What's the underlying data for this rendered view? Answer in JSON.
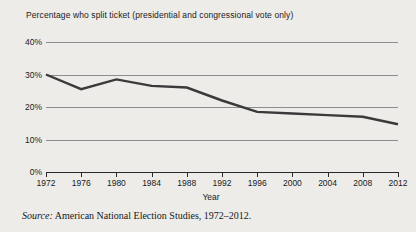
{
  "figure": {
    "title": "Percentage who split ticket (presidential and congressional vote only)",
    "source_prefix": "Source:",
    "source_text": "American National Election Studies, 1972–2012.",
    "xlabel": "Year",
    "line_color": "#3a3a3a",
    "grid_color": "#8d8d8d",
    "background": "#edece9"
  },
  "chart_data": {
    "type": "line",
    "title": "Percentage who split ticket (presidential and congressional vote only)",
    "xlabel": "Year",
    "ylabel": "",
    "x": [
      1972,
      1976,
      1980,
      1984,
      1988,
      1992,
      1996,
      2000,
      2004,
      2008,
      2012
    ],
    "categories": [
      "1972",
      "1976",
      "1980",
      "1984",
      "1988",
      "1992",
      "1996",
      "2000",
      "2004",
      "2008",
      "2012"
    ],
    "values": [
      30,
      25.5,
      28.5,
      26.5,
      26,
      22,
      18.5,
      18,
      17.5,
      17,
      14.7
    ],
    "series": [
      {
        "name": "Percentage who split ticket",
        "values": [
          30,
          25.5,
          28.5,
          26.5,
          26,
          22,
          18.5,
          18,
          17.5,
          17,
          14.7
        ]
      }
    ],
    "ylim": [
      0,
      40
    ],
    "yticks": [
      0,
      10,
      20,
      30,
      40
    ],
    "ytick_labels": [
      "0%",
      "10%",
      "20%",
      "30%",
      "40%"
    ],
    "xlim": [
      1972,
      2012
    ],
    "grid": "horizontal",
    "legend": "none"
  }
}
